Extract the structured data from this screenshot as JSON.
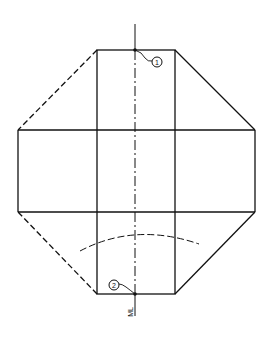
{
  "diagram": {
    "type": "technical-drawing-development",
    "callouts": [
      {
        "id": "callout-1",
        "label": "1"
      },
      {
        "id": "callout-2",
        "label": "2"
      }
    ],
    "centerline_label": "ML",
    "colors": {
      "line": "#111111",
      "background": "#ffffff"
    }
  }
}
